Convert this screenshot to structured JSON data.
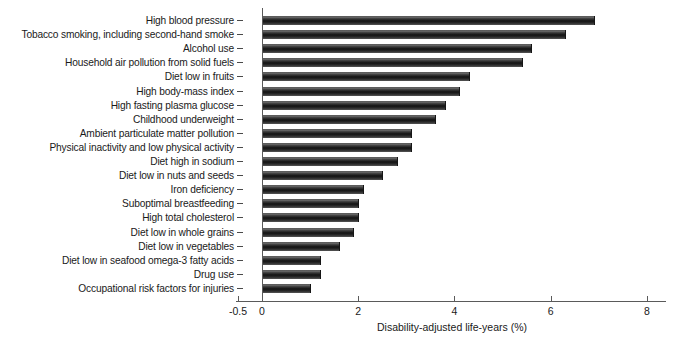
{
  "chart_data": {
    "type": "bar",
    "orientation": "horizontal",
    "title": "",
    "xlabel": "Disability-adjusted life-years (%)",
    "ylabel": "",
    "xlim": [
      -0.5,
      8.4
    ],
    "xticks": [
      -0.5,
      0,
      2,
      4,
      6,
      8
    ],
    "xticklabels": [
      "-0.5",
      "0",
      "2",
      "4",
      "6",
      "8"
    ],
    "grid": false,
    "legend": null,
    "bar_color": "#1a1a1a",
    "categories": [
      "High blood pressure",
      "Tobacco smoking, including second-hand smoke",
      "Alcohol use",
      "Household air pollution from solid fuels",
      "Diet low in fruits",
      "High body-mass index",
      "High fasting plasma glucose",
      "Childhood underweight",
      "Ambient particulate matter pollution",
      "Physical inactivity and low physical activity",
      "Diet high in sodium",
      "Diet low in nuts and seeds",
      "Iron deficiency",
      "Suboptimal breastfeeding",
      "High total cholesterol",
      "Diet low in whole grains",
      "Diet low in vegetables",
      "Diet low in seafood omega-3 fatty acids",
      "Drug use",
      "Occupational risk factors for injuries"
    ],
    "values": [
      6.9,
      6.3,
      5.6,
      5.4,
      4.3,
      4.1,
      3.8,
      3.6,
      3.1,
      3.1,
      2.8,
      2.5,
      2.1,
      2.0,
      2.0,
      1.9,
      1.6,
      1.2,
      1.2,
      1.0
    ]
  },
  "axis": {
    "x_title": "Disability-adjusted life-years (%)"
  }
}
